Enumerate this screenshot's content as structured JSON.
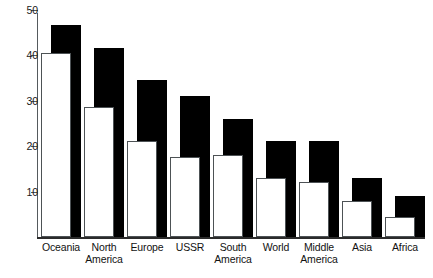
{
  "chart_data": {
    "type": "bar",
    "title": "",
    "subtitle": "",
    "xlabel": "",
    "ylabel": "",
    "ylim": [
      0,
      50
    ],
    "yticks": [
      10,
      20,
      30,
      40,
      50
    ],
    "ytick_labels": [
      "10",
      "20",
      "30",
      "40",
      "50"
    ],
    "grid": false,
    "legend_position": "none",
    "categories": [
      "Oceania",
      "North America",
      "Europe",
      "USSR",
      "South America",
      "World",
      "Middle America",
      "Asia",
      "Africa"
    ],
    "category_lines": [
      [
        "Oceania"
      ],
      [
        "North",
        "America"
      ],
      [
        "Europe"
      ],
      [
        "USSR"
      ],
      [
        "South",
        "America"
      ],
      [
        "World"
      ],
      [
        "Middle",
        "America"
      ],
      [
        "Asia"
      ],
      [
        "Africa"
      ]
    ],
    "series": [
      {
        "name": "back-series",
        "color": "#000000",
        "values": [
          46.5,
          41.5,
          34.5,
          31.0,
          26.0,
          21.0,
          21.0,
          13.0,
          9.0
        ]
      },
      {
        "name": "front-series",
        "color": "#ffffff",
        "values": [
          40.5,
          28.5,
          21.0,
          17.5,
          18.0,
          13.0,
          12.0,
          8.0,
          4.5
        ]
      }
    ]
  },
  "axis": {
    "axis_color": "#555a5d",
    "baseline_color": "#2b2b2b"
  }
}
